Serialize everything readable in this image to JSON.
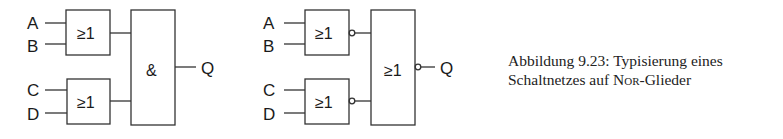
{
  "figure": {
    "left_circuit": {
      "inputs": [
        "A",
        "B",
        "C",
        "D"
      ],
      "gate_top": "≥1",
      "gate_bottom": "≥1",
      "gate_out": "&",
      "output": "Q"
    },
    "right_circuit": {
      "inputs": [
        "A",
        "B",
        "C",
        "D"
      ],
      "gate_top": "≥1",
      "gate_bottom": "≥1",
      "gate_out": "≥1",
      "output": "Q"
    },
    "caption": {
      "line1": "Abbildung 9.23: Typisierung eines",
      "line2_pre": "Schaltnetzes auf ",
      "line2_sc": "Nor",
      "line2_post": "-Glieder"
    }
  }
}
